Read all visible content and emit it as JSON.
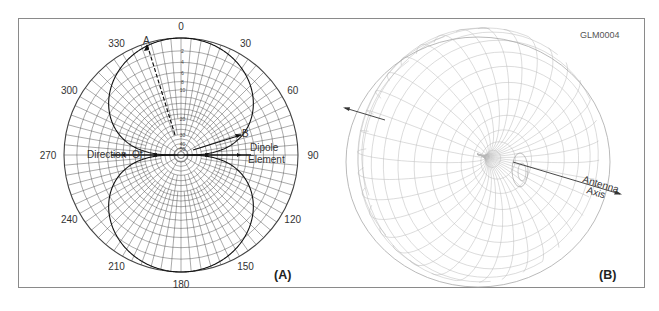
{
  "figure_code": "GLM0004",
  "panel_a": {
    "label": "(A)",
    "angle_labels": [
      {
        "deg": 0,
        "text": "0"
      },
      {
        "deg": 30,
        "text": "30"
      },
      {
        "deg": 60,
        "text": "60"
      },
      {
        "deg": 90,
        "text": "90"
      },
      {
        "deg": 120,
        "text": "120"
      },
      {
        "deg": 150,
        "text": "150"
      },
      {
        "deg": 180,
        "text": "180"
      },
      {
        "deg": 210,
        "text": "210"
      },
      {
        "deg": 240,
        "text": "240"
      },
      {
        "deg": 270,
        "text": "270"
      },
      {
        "deg": 300,
        "text": "300"
      },
      {
        "deg": 330,
        "text": "330"
      }
    ],
    "db_scale_labels": [
      "2",
      "4",
      "6",
      "8",
      "10",
      "20",
      "30",
      "40",
      "50"
    ],
    "point_a_label": "A",
    "point_b_label": "B",
    "direction_label": "Direction  Of",
    "dipole_label_line1": "Dipole",
    "dipole_label_line2": "Element"
  },
  "panel_b": {
    "label": "(B)",
    "axis_label_line1": "Antenna",
    "axis_label_line2": "Axis"
  },
  "colors": {
    "frame": "#8a8a8a",
    "grid": "#444444",
    "pattern": "#111111",
    "mesh": "#b8b8b8"
  }
}
